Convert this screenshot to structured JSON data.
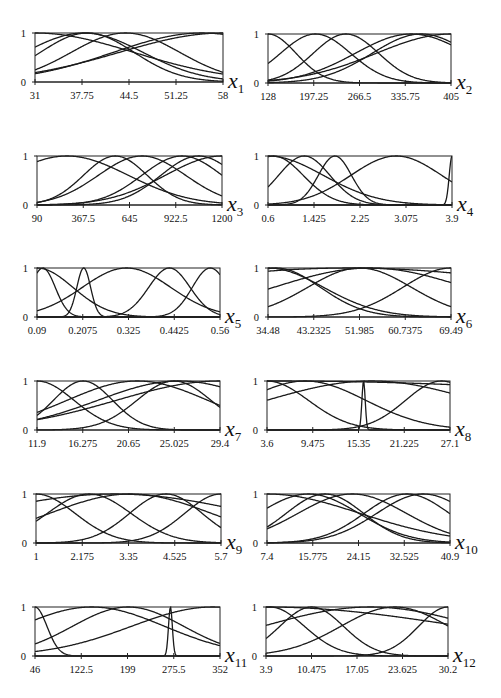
{
  "figure": {
    "width": 501,
    "height": 698,
    "y_tick_labels": [
      "0",
      "1"
    ]
  },
  "chart_data": [
    {
      "type": "line",
      "title": "Membership functions for input variable x1",
      "var": "x",
      "sub": "1",
      "xlabel": "x1",
      "ylabel": "",
      "xlim": [
        31,
        58
      ],
      "ylim": [
        0,
        1
      ],
      "xticks": [
        "31",
        "37.75",
        "44.5",
        "51.25",
        "58"
      ],
      "grid": false,
      "frame": {
        "x": 35,
        "y": 33,
        "w": 188,
        "h": 49
      },
      "series": [
        {
          "name": "MF1",
          "shape": "bell",
          "c": 31.0,
          "s": 20.0
        },
        {
          "name": "MF2",
          "shape": "bell",
          "c": 38.5,
          "s": 9.5
        },
        {
          "name": "MF3",
          "shape": "bell",
          "c": 44.0,
          "s": 11.0
        },
        {
          "name": "MF4",
          "shape": "bell",
          "c": 55.0,
          "s": 18.0
        },
        {
          "name": "MF5",
          "shape": "bell",
          "c": 58.0,
          "s": 21.0
        },
        {
          "name": "MF6",
          "shape": "bell",
          "c": 38.0,
          "s": 12.0
        }
      ]
    },
    {
      "type": "line",
      "title": "Membership functions for input variable x2",
      "var": "x",
      "sub": "2",
      "xlabel": "x2",
      "ylabel": "",
      "xlim": [
        128,
        405
      ],
      "ylim": [
        0,
        1
      ],
      "xticks": [
        "128",
        "197.25",
        "266.5",
        "335.75",
        "405"
      ],
      "grid": false,
      "frame": {
        "x": 268,
        "y": 34,
        "w": 183,
        "h": 49
      },
      "series": [
        {
          "name": "MF1",
          "shape": "bell",
          "c": 128.0,
          "s": 60.0
        },
        {
          "name": "MF2",
          "shape": "bell",
          "c": 200.0,
          "s": 75.0
        },
        {
          "name": "MF3",
          "shape": "bell",
          "c": 246.0,
          "s": 70.0
        },
        {
          "name": "MF4",
          "shape": "bell",
          "c": 345.0,
          "s": 120.0
        },
        {
          "name": "MF5",
          "shape": "bell",
          "c": 360.0,
          "s": 105.0
        },
        {
          "name": "MF6",
          "shape": "bell",
          "c": 405.0,
          "s": 160.0
        }
      ]
    },
    {
      "type": "line",
      "title": "Membership functions for input variable x3",
      "var": "x",
      "sub": "3",
      "xlabel": "x3",
      "ylabel": "",
      "xlim": [
        90,
        1200
      ],
      "ylim": [
        0,
        1
      ],
      "xticks": [
        "90",
        "367.5",
        "645",
        "922.5",
        "1200"
      ],
      "grid": false,
      "frame": {
        "x": 37,
        "y": 156,
        "w": 185,
        "h": 49
      },
      "series": [
        {
          "name": "MF1",
          "shape": "bell",
          "c": 270.0,
          "s": 520.0
        },
        {
          "name": "MF2",
          "shape": "bell",
          "c": 560.0,
          "s": 270.0
        },
        {
          "name": "MF3",
          "shape": "bell",
          "c": 720.0,
          "s": 370.0
        },
        {
          "name": "MF4",
          "shape": "bell",
          "c": 960.0,
          "s": 340.0
        },
        {
          "name": "MF5",
          "shape": "bell",
          "c": 1060.0,
          "s": 320.0
        },
        {
          "name": "MF6",
          "shape": "bell",
          "c": 1200.0,
          "s": 480.0
        }
      ]
    },
    {
      "type": "line",
      "title": "Membership functions for input variable x4",
      "var": "x",
      "sub": "4",
      "xlabel": "x4",
      "ylabel": "",
      "xlim": [
        0.6,
        3.9
      ],
      "ylim": [
        0,
        1
      ],
      "xticks": [
        "0.6",
        "1.425",
        "2.25",
        "3.075",
        "3.9"
      ],
      "grid": false,
      "frame": {
        "x": 268,
        "y": 156,
        "w": 184,
        "h": 49
      },
      "series": [
        {
          "name": "MF1",
          "shape": "bell",
          "c": 0.7,
          "s": 0.75
        },
        {
          "name": "MF2",
          "shape": "bell",
          "c": 1.25,
          "s": 0.65
        },
        {
          "name": "MF3",
          "shape": "bell",
          "c": 1.8,
          "s": 0.42
        },
        {
          "name": "MF4",
          "shape": "bell",
          "c": 2.9,
          "s": 1.15
        },
        {
          "name": "MF5",
          "shape": "bell",
          "c": 0.6,
          "s": 1.4
        },
        {
          "name": "MF6",
          "shape": "bell",
          "c": 3.9,
          "s": 0.07
        }
      ]
    },
    {
      "type": "line",
      "title": "Membership functions for input variable x5",
      "var": "x",
      "sub": "5",
      "xlabel": "x5",
      "ylabel": "",
      "xlim": [
        0.09,
        0.56
      ],
      "ylim": [
        0,
        1
      ],
      "xticks": [
        "0.09",
        "0.2075",
        "0.325",
        "0.4425",
        "0.56"
      ],
      "grid": false,
      "frame": {
        "x": 37,
        "y": 268,
        "w": 183,
        "h": 49
      },
      "series": [
        {
          "name": "MF1",
          "shape": "bell",
          "c": 0.105,
          "s": 0.045
        },
        {
          "name": "MF2",
          "shape": "bell",
          "c": 0.21,
          "s": 0.025
        },
        {
          "name": "MF3",
          "shape": "bell",
          "c": 0.32,
          "s": 0.16
        },
        {
          "name": "MF4",
          "shape": "bell",
          "c": 0.43,
          "s": 0.075
        },
        {
          "name": "MF5",
          "shape": "bell",
          "c": 0.535,
          "s": 0.065
        },
        {
          "name": "MF6",
          "shape": "bell",
          "c": 0.09,
          "s": 0.13
        }
      ]
    },
    {
      "type": "line",
      "title": "Membership functions for input variable x6",
      "var": "x",
      "sub": "6",
      "xlabel": "x6",
      "ylabel": "",
      "xlim": [
        34.48,
        69.49
      ],
      "ylim": [
        0,
        1
      ],
      "xticks": [
        "34.48",
        "43.2325",
        "51.985",
        "60.7375",
        "69.49"
      ],
      "grid": false,
      "frame": {
        "x": 268,
        "y": 268,
        "w": 183,
        "h": 49
      },
      "series": [
        {
          "name": "MF1",
          "shape": "bell",
          "c": 36.0,
          "s": 12.0
        },
        {
          "name": "MF2",
          "shape": "bell",
          "c": 52.0,
          "s": 14.0
        },
        {
          "name": "MF3",
          "shape": "bell",
          "c": 54.0,
          "s": 26.0
        },
        {
          "name": "MF4",
          "shape": "bell",
          "c": 69.49,
          "s": 13.0
        },
        {
          "name": "MF5",
          "shape": "bell",
          "c": 50.0,
          "s": 60.0
        },
        {
          "name": "MF6",
          "shape": "bell",
          "c": 34.48,
          "s": 15.0
        }
      ]
    },
    {
      "type": "line",
      "title": "Membership functions for input variable x7",
      "var": "x",
      "sub": "7",
      "xlabel": "x7",
      "ylabel": "",
      "xlim": [
        11.9,
        29.4
      ],
      "ylim": [
        0,
        1
      ],
      "xticks": [
        "11.9",
        "16.275",
        "20.65",
        "25.025",
        "29.4"
      ],
      "grid": false,
      "frame": {
        "x": 37,
        "y": 381,
        "w": 183,
        "h": 49
      },
      "series": [
        {
          "name": "MF1",
          "shape": "bell",
          "c": 11.9,
          "s": 5.0
        },
        {
          "name": "MF2",
          "shape": "bell",
          "c": 16.3,
          "s": 4.0
        },
        {
          "name": "MF3",
          "shape": "bell",
          "c": 21.5,
          "s": 9.5
        },
        {
          "name": "MF4",
          "shape": "bell",
          "c": 25.0,
          "s": 5.0
        },
        {
          "name": "MF5",
          "shape": "bell",
          "c": 29.4,
          "s": 14.0
        },
        {
          "name": "MF6",
          "shape": "bell",
          "c": 25.5,
          "s": 11.0
        }
      ]
    },
    {
      "type": "line",
      "title": "Membership functions for input variable x8",
      "var": "x",
      "sub": "8",
      "xlabel": "x8",
      "ylabel": "",
      "xlim": [
        3.6,
        27.1
      ],
      "ylim": [
        0,
        1
      ],
      "xticks": [
        "3.6",
        "9.475",
        "15.35",
        "21.225",
        "27.1"
      ],
      "grid": false,
      "frame": {
        "x": 267,
        "y": 381,
        "w": 183,
        "h": 49
      },
      "series": [
        {
          "name": "MF1",
          "shape": "bell",
          "c": 3.6,
          "s": 7.5
        },
        {
          "name": "MF2",
          "shape": "bell",
          "c": 8.5,
          "s": 11.0
        },
        {
          "name": "MF3",
          "shape": "bell",
          "c": 17.0,
          "s": 19.0
        },
        {
          "name": "MF4",
          "shape": "bell",
          "c": 16.0,
          "s": 0.3
        },
        {
          "name": "MF5",
          "shape": "bell",
          "c": 26.0,
          "s": 6.5
        },
        {
          "name": "MF6",
          "shape": "bell",
          "c": 5.0,
          "s": 80.0
        }
      ]
    },
    {
      "type": "line",
      "title": "Membership functions for input variable x9",
      "var": "x",
      "sub": "9",
      "xlabel": "x9",
      "ylabel": "",
      "xlim": [
        1,
        5.7
      ],
      "ylim": [
        0,
        1
      ],
      "xticks": [
        "1",
        "2.175",
        "3.35",
        "4.525",
        "5.7"
      ],
      "grid": false,
      "frame": {
        "x": 36,
        "y": 494,
        "w": 185,
        "h": 49
      },
      "series": [
        {
          "name": "MF1",
          "shape": "bell",
          "c": 1.0,
          "s": 1.4
        },
        {
          "name": "MF2",
          "shape": "bell",
          "c": 2.35,
          "s": 1.5
        },
        {
          "name": "MF3",
          "shape": "bell",
          "c": 3.4,
          "s": 2.9
        },
        {
          "name": "MF4",
          "shape": "bell",
          "c": 4.3,
          "s": 1.3
        },
        {
          "name": "MF5",
          "shape": "bell",
          "c": 5.7,
          "s": 1.3
        },
        {
          "name": "MF6",
          "shape": "bell",
          "c": 3.0,
          "s": 5.0
        }
      ]
    },
    {
      "type": "line",
      "title": "Membership functions for input variable x10",
      "var": "x",
      "sub": "10",
      "xlabel": "x10",
      "ylabel": "",
      "xlim": [
        7.4,
        40.9
      ],
      "ylim": [
        0,
        1
      ],
      "xticks": [
        "7.4",
        "15.775",
        "24.15",
        "32.525",
        "40.9"
      ],
      "grid": false,
      "frame": {
        "x": 267,
        "y": 494,
        "w": 183,
        "h": 49
      },
      "series": [
        {
          "name": "MF1",
          "shape": "bell",
          "c": 15.0,
          "s": 13.0
        },
        {
          "name": "MF2",
          "shape": "bell",
          "c": 18.0,
          "s": 10.0
        },
        {
          "name": "MF3",
          "shape": "bell",
          "c": 23.0,
          "s": 14.0
        },
        {
          "name": "MF4",
          "shape": "bell",
          "c": 33.0,
          "s": 11.0
        },
        {
          "name": "MF5",
          "shape": "bell",
          "c": 36.0,
          "s": 12.0
        },
        {
          "name": "MF6",
          "shape": "bell",
          "c": 7.4,
          "s": 24.0
        }
      ]
    },
    {
      "type": "line",
      "title": "Membership functions for input variable x11",
      "var": "x",
      "sub": "11",
      "xlabel": "x11",
      "ylabel": "",
      "xlim": [
        46,
        352
      ],
      "ylim": [
        0,
        1
      ],
      "xticks": [
        "46",
        "122.5",
        "199",
        "275.5",
        "352"
      ],
      "grid": false,
      "frame": {
        "x": 35,
        "y": 607,
        "w": 185,
        "h": 49
      },
      "series": [
        {
          "name": "MF1",
          "shape": "bell",
          "c": 46.0,
          "s": 28.0
        },
        {
          "name": "MF2",
          "shape": "bell",
          "c": 140.0,
          "s": 170.0
        },
        {
          "name": "MF3",
          "shape": "bell",
          "c": 200.0,
          "s": 130.0
        },
        {
          "name": "MF4",
          "shape": "bell",
          "c": 340.0,
          "s": 190.0
        },
        {
          "name": "MF5",
          "shape": "bell",
          "c": 270.0,
          "s": 4.5
        }
      ]
    },
    {
      "type": "line",
      "title": "Membership functions for input variable x12",
      "var": "x",
      "sub": "12",
      "xlabel": "x12",
      "ylabel": "",
      "xlim": [
        3.9,
        30.2
      ],
      "ylim": [
        0,
        1
      ],
      "xticks": [
        "3.9",
        "10.475",
        "17.05",
        "23.625",
        "30.2"
      ],
      "grid": false,
      "frame": {
        "x": 266,
        "y": 607,
        "w": 182,
        "h": 49
      },
      "series": [
        {
          "name": "MF1",
          "shape": "bell",
          "c": 4.5,
          "s": 7.0
        },
        {
          "name": "MF2",
          "shape": "bell",
          "c": 10.5,
          "s": 6.5
        },
        {
          "name": "MF3",
          "shape": "bell",
          "c": 19.0,
          "s": 22.0
        },
        {
          "name": "MF4",
          "shape": "bell",
          "c": 22.5,
          "s": 11.0
        },
        {
          "name": "MF5",
          "shape": "bell",
          "c": 30.2,
          "s": 6.0
        },
        {
          "name": "MF6",
          "shape": "bell",
          "c": 3.9,
          "s": 40.0
        }
      ]
    }
  ]
}
